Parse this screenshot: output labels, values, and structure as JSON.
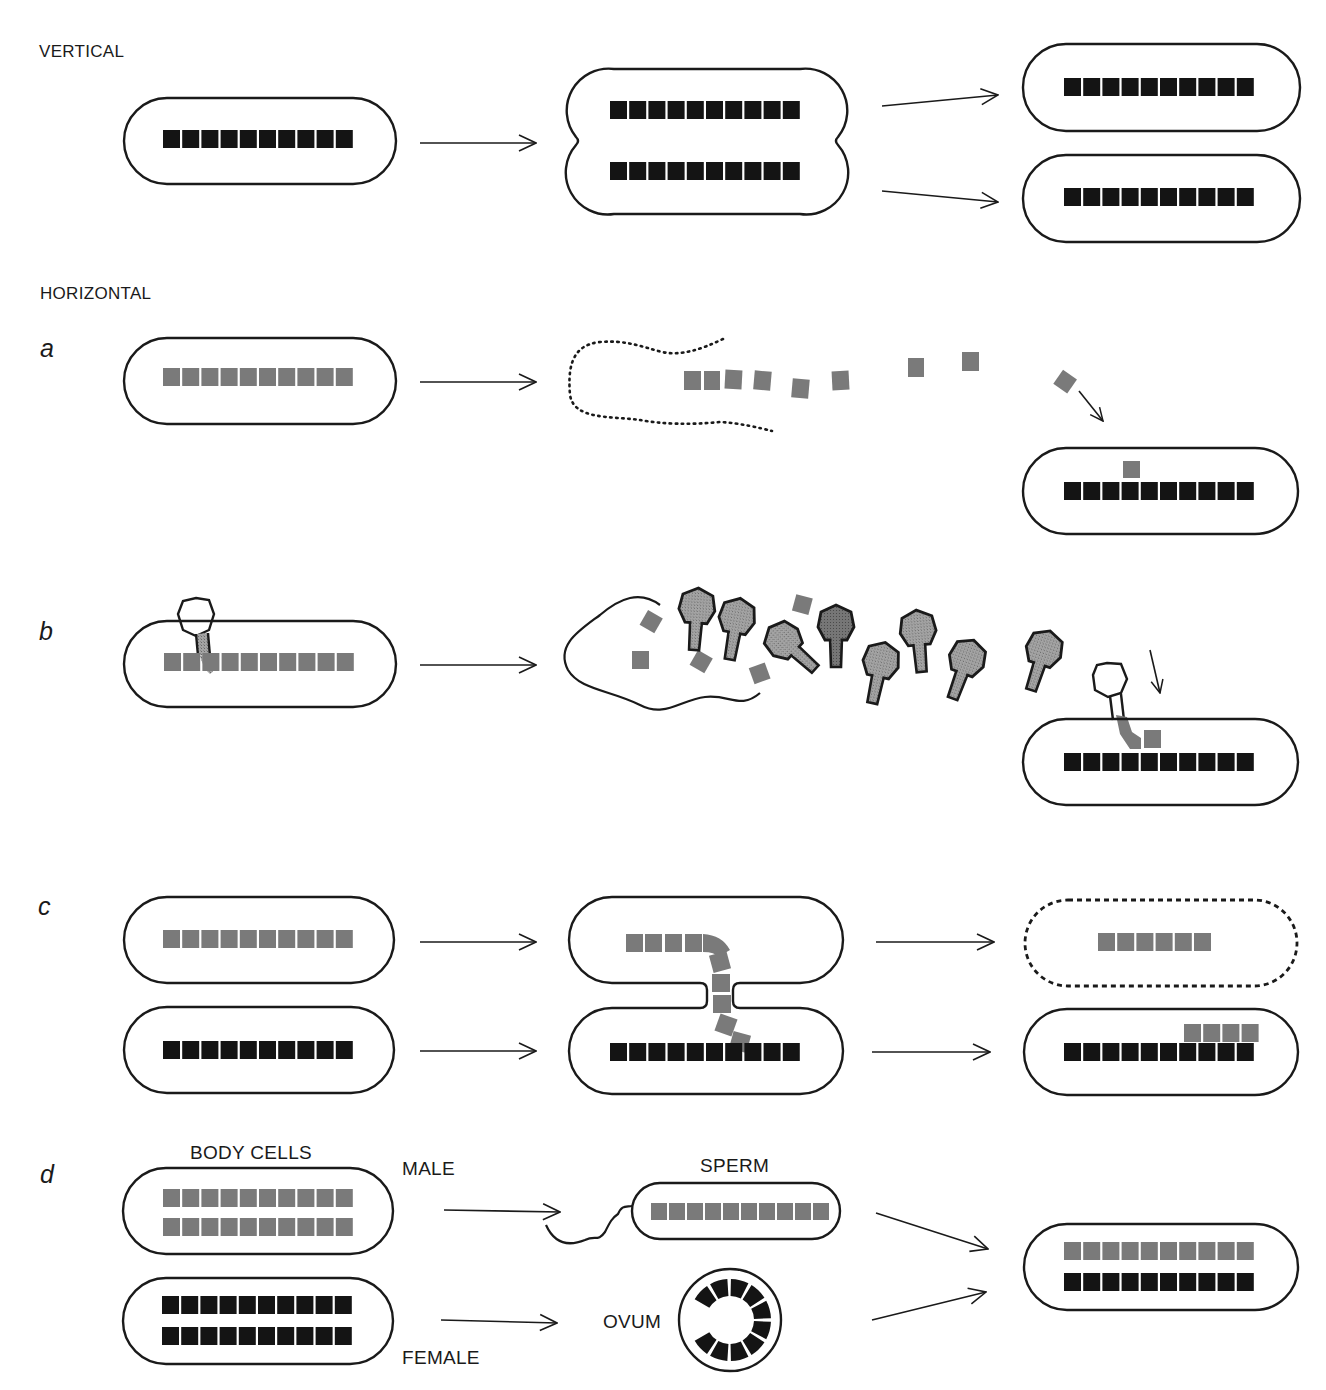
{
  "colors": {
    "host_gene": "#141414",
    "foreign_gene": "#7a7a7a",
    "outline": "#1a1a1a",
    "phage_fill": "#9a9a9a",
    "phage_dark_fill": "#6e6e6e",
    "background": "#ffffff"
  },
  "sections": {
    "vertical": {
      "title": "VERTICAL"
    },
    "horizontal": {
      "title": "HORIZONTAL"
    }
  },
  "panels": {
    "a": {
      "letter": "a",
      "process": "transformation",
      "donor_genes": 10,
      "free_fragments": 8,
      "recipient_genes": 10,
      "integrated_genes": 1
    },
    "b": {
      "letter": "b",
      "process": "transduction",
      "donor_genes": 10,
      "phage_particles": 8,
      "free_fragments": 5,
      "recipient_genes": 10,
      "integrated_genes": 1
    },
    "c": {
      "letter": "c",
      "process": "conjugation",
      "donor_genes": 10,
      "transferred_genes": 10,
      "remaining_donor_genes": 6,
      "recipient_genes": 10,
      "integrated_genes": 4
    },
    "d": {
      "letter": "d",
      "process": "sexual reproduction",
      "labels": {
        "body_cells": "BODY CELLS",
        "male": "MALE",
        "female": "FEMALE",
        "sperm": "SPERM",
        "ovum": "OVUM"
      },
      "body_cell_rows": 2,
      "genes_per_row": 10,
      "ovum_segments": 10,
      "offspring_rows": 2
    }
  },
  "vertical": {
    "parent_genes": 10,
    "dividing_rows": 2,
    "daughter_cells": 2
  }
}
